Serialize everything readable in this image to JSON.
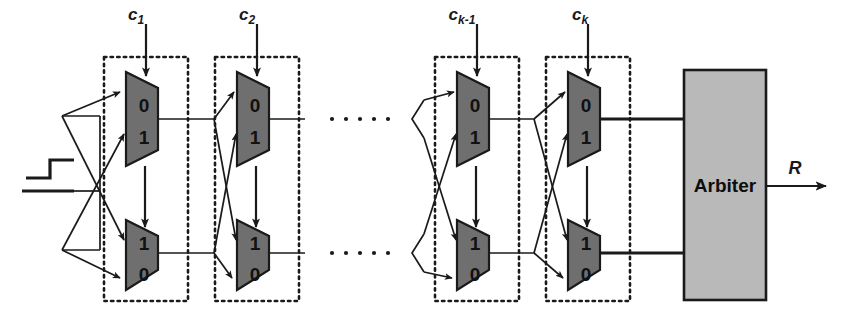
{
  "figure": {
    "background_color": "#ffffff",
    "width": 848,
    "height": 331
  },
  "palette": {
    "mux_fill": "#6f6f6f",
    "mux_stroke": "#1a1a1a",
    "arbiter_fill": "#b9b9b9",
    "arbiter_stroke": "#1a1a1a",
    "wire": "#1a1a1a",
    "dotted_box": "#1a1a1a",
    "text": "#111111"
  },
  "input": {
    "signal_name": "step-pulse",
    "glyph": "rising-edge-step"
  },
  "stages": [
    {
      "id": "stage-1",
      "control_label": "c",
      "control_subscript": "1",
      "top_mux": {
        "upper_digit": "0",
        "lower_digit": "1"
      },
      "bottom_mux": {
        "upper_digit": "1",
        "lower_digit": "0"
      },
      "box_x": 104,
      "box_w": 84
    },
    {
      "id": "stage-2",
      "control_label": "c",
      "control_subscript": "2",
      "top_mux": {
        "upper_digit": "0",
        "lower_digit": "1"
      },
      "bottom_mux": {
        "upper_digit": "1",
        "lower_digit": "0"
      },
      "box_x": 215,
      "box_w": 84
    },
    {
      "id": "stage-k-minus-1",
      "control_label": "c",
      "control_subscript": "k-1",
      "top_mux": {
        "upper_digit": "0",
        "lower_digit": "1"
      },
      "bottom_mux": {
        "upper_digit": "1",
        "lower_digit": "0"
      },
      "box_x": 435,
      "box_w": 84
    },
    {
      "id": "stage-k",
      "control_label": "c",
      "control_subscript": "k",
      "top_mux": {
        "upper_digit": "0",
        "lower_digit": "1"
      },
      "bottom_mux": {
        "upper_digit": "1",
        "lower_digit": "0"
      },
      "box_x": 546,
      "box_w": 84
    }
  ],
  "ellipsis": {
    "glyph": "horizontal-dots",
    "rows": [
      "upper",
      "lower"
    ],
    "dot_count": 5
  },
  "arbiter": {
    "label": "Arbiter",
    "x": 684,
    "y": 70,
    "width": 82,
    "height": 230
  },
  "output": {
    "label": "R",
    "arrow": "right-arrow"
  }
}
